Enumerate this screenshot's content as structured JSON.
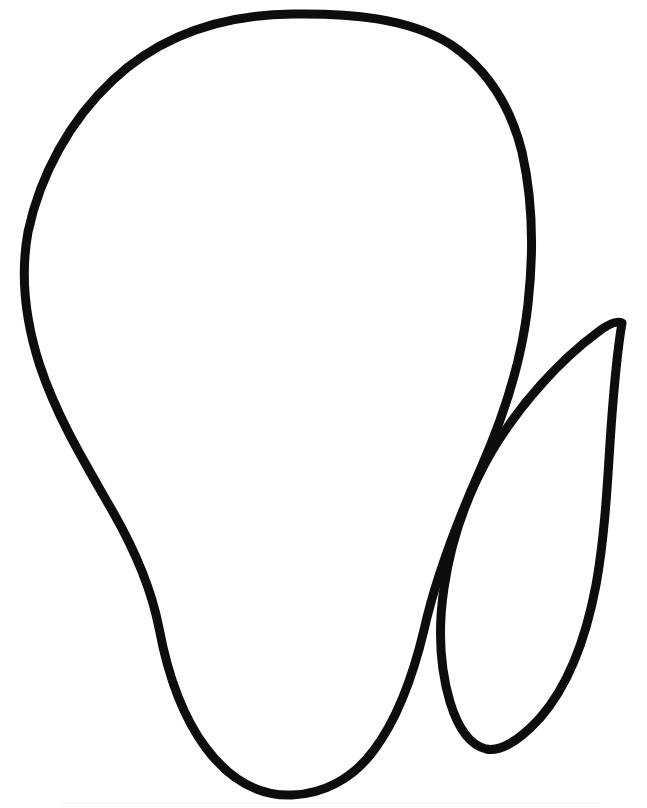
{
  "document": {
    "kind": "line-art-clipart",
    "title": "Fruit and leaf outline drawing",
    "canvas_width": 647,
    "canvas_height": 808,
    "background_color": "#ffffff",
    "ink_color": "#0d0d0d",
    "stroke_width": 9,
    "text_content": "",
    "visible_labels": []
  },
  "shapes": {
    "body": {
      "name": "fruit-body-outline",
      "description": "Large closed outline shape, rounded broad top narrowing toward a U-shaped base",
      "stroke_width": 9,
      "stroke_color": "#0d0d0d",
      "fill": "none",
      "extremes": {
        "top_y": 14,
        "left_x": 25,
        "right_x": 532,
        "bottom_y": 795,
        "top_apex_x": 292,
        "bottom_apex_x": 292
      },
      "path": "M 292 14 C 220 15 160 36 113 80 C 70 120 40 175 28 232 C 20 276 25 320 40 366 C 58 420 88 468 113 512 C 137 554 152 592 159 628 C 168 676 182 716 206 748 C 233 784 263 796 292 795 C 322 794 352 780 374 750 C 398 718 413 676 424 630 C 436 576 458 520 480 470 C 504 416 522 360 528 304 C 534 250 532 196 522 152 C 510 104 486 68 450 44 C 408 18 350 13 292 14 Z"
    },
    "leaf": {
      "name": "leaf-outline",
      "description": "Narrow pointed leaf outline to the right of the body, sharp tip at top right, rounded tip at bottom left",
      "stroke_width": 9,
      "stroke_color": "#0d0d0d",
      "fill": "none",
      "extremes": {
        "tip_x": 622,
        "tip_y": 323,
        "right_x": 609,
        "bottom_x": 486,
        "bottom_y": 749
      },
      "path": "M 622 323 C 617 352 613 398 610 443 C 607 492 604 541 596 585 C 586 638 568 686 540 718 C 519 741 500 752 486 749 C 470 745 458 728 450 702 C 440 668 438 628 444 588 C 451 540 468 492 492 451 C 520 404 560 360 598 332 C 607 325 616 320 622 323 Z"
    },
    "speck": {
      "name": "paper-speck-dot",
      "description": "Tiny white pinhole speck inside the leaf tip stroke",
      "cx": 592,
      "cy": 364,
      "r": 2.2,
      "color": "#ffffff"
    }
  }
}
